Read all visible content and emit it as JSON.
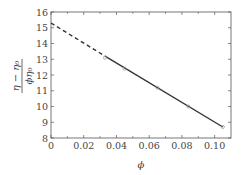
{
  "chart_data": {
    "type": "line",
    "title": "",
    "xlabel": "ϕ",
    "ylabel_num": "η − η₀",
    "ylabel_den": "ϕη₀",
    "xlim": [
      0,
      0.11
    ],
    "ylim": [
      8,
      16
    ],
    "x_ticks": [
      0,
      0.02,
      0.04,
      0.06,
      0.08,
      0.1
    ],
    "x_tick_labels": [
      "0",
      "0.02",
      "0.04",
      "0.06",
      "0.08",
      "0.10"
    ],
    "y_ticks": [
      8,
      9,
      10,
      11,
      12,
      13,
      14,
      15,
      16
    ],
    "y_tick_labels": [
      "8",
      "9",
      "10",
      "11",
      "12",
      "13",
      "14",
      "15",
      "16"
    ],
    "grid": false,
    "legend": null,
    "series": [
      {
        "name": "linear fit (extrapolated)",
        "style": "dashed",
        "x": [
          0,
          0.033
        ],
        "y": [
          15.3,
          13.2
        ]
      },
      {
        "name": "linear fit",
        "style": "solid",
        "x": [
          0.033,
          0.105
        ],
        "y": [
          13.2,
          8.7
        ]
      },
      {
        "name": "data",
        "style": "markers",
        "x": [
          0.033,
          0.045,
          0.065,
          0.084,
          0.105
        ],
        "y": [
          13.1,
          12.4,
          11.2,
          10.0,
          8.7
        ]
      }
    ]
  },
  "colors": {
    "line": "#333333",
    "axis": "#555555",
    "marker": "#999999"
  }
}
